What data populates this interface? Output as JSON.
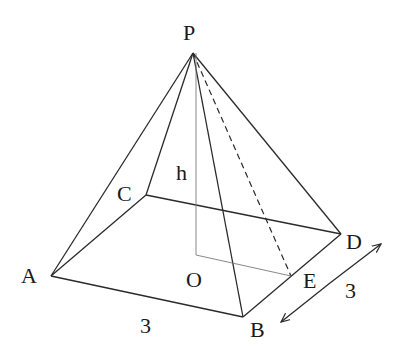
{
  "figure": {
    "type": "square pyramid",
    "labels": {
      "apex": "P",
      "height": "h",
      "A": "A",
      "B": "B",
      "C": "C",
      "D": "D",
      "O": "O",
      "E": "E",
      "base_side_AB": "3",
      "base_side_BD": "3"
    },
    "colors": {
      "line": "#2a2a2a",
      "height_line": "#7a7a7a",
      "background": "#ffffff"
    }
  }
}
